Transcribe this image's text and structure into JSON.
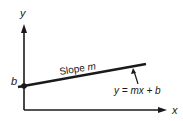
{
  "diagram": {
    "axes": {
      "x_label": "x",
      "y_label": "y"
    },
    "intercept_label": "b",
    "slope_label_prefix": "Slope",
    "slope_label_var": "m",
    "equation": "y = mx + b",
    "colors": {
      "ink": "#1a1a1a",
      "background": "#ffffff"
    }
  }
}
